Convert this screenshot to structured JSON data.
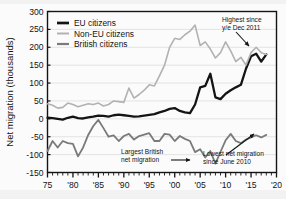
{
  "chart_data": {
    "type": "line",
    "title": "",
    "xlabel": "",
    "ylabel": "Net migration (thousands)",
    "xlim": [
      1975,
      2020
    ],
    "ylim": [
      -150,
      300
    ],
    "ytick_values": [
      300,
      250,
      200,
      150,
      100,
      50,
      0,
      -50,
      -100,
      -150
    ],
    "ytick_labels": [
      "300",
      "250",
      "200",
      "150",
      "100",
      "50",
      "0",
      "-50",
      "-100",
      "-150"
    ],
    "xtick_values": [
      1975,
      1980,
      1985,
      1990,
      1995,
      2000,
      2005,
      2010,
      2015,
      2020
    ],
    "xtick_labels": [
      "75",
      "'80",
      "'85",
      "'90",
      "'95",
      "'00",
      "'05",
      "'10",
      "'15",
      "'20"
    ],
    "minor_xtick_step": 1,
    "grid": "horizontal",
    "legend_position": "top-left",
    "x": [
      1975,
      1976,
      1977,
      1978,
      1979,
      1980,
      1981,
      1982,
      1983,
      1984,
      1985,
      1986,
      1987,
      1988,
      1989,
      1990,
      1991,
      1992,
      1993,
      1994,
      1995,
      1996,
      1997,
      1998,
      1999,
      2000,
      2001,
      2002,
      2003,
      2004,
      2005,
      2006,
      2007,
      2008,
      2009,
      2010,
      2011,
      2012,
      2013,
      2014,
      2015,
      2016,
      2017,
      2018
    ],
    "series": [
      {
        "name": "EU citizens",
        "color": "#141414",
        "width": 2.3,
        "values": [
          3,
          2,
          0,
          -2,
          3,
          6,
          2,
          1,
          4,
          6,
          9,
          8,
          6,
          10,
          12,
          10,
          8,
          6,
          7,
          9,
          11,
          13,
          18,
          22,
          28,
          30,
          22,
          18,
          16,
          40,
          88,
          92,
          126,
          60,
          55,
          70,
          80,
          88,
          95,
          140,
          175,
          182,
          160,
          180
        ]
      },
      {
        "name": "Non-EU citizens",
        "color": "#b2b2b2",
        "width": 1.6,
        "values": [
          42,
          38,
          30,
          32,
          44,
          40,
          34,
          38,
          42,
          40,
          44,
          36,
          40,
          50,
          48,
          46,
          86,
          58,
          68,
          80,
          95,
          92,
          120,
          150,
          200,
          225,
          222,
          235,
          245,
          262,
          205,
          215,
          195,
          170,
          185,
          215,
          190,
          160,
          172,
          150,
          185,
          200,
          185,
          180
        ]
      },
      {
        "name": "British citizens",
        "color": "#7a7a7a",
        "width": 1.8,
        "values": [
          -90,
          -62,
          -80,
          -62,
          -68,
          -70,
          -105,
          -80,
          -45,
          -20,
          -3,
          -26,
          -50,
          -46,
          -62,
          -48,
          -42,
          -58,
          -48,
          -44,
          -40,
          -62,
          -62,
          -42,
          -44,
          -62,
          -48,
          -56,
          -62,
          -93,
          -85,
          -108,
          -90,
          -125,
          -92,
          -60,
          -42,
          -62,
          -68,
          -58,
          -52,
          -46,
          -52,
          -45
        ]
      }
    ],
    "annotations": [
      {
        "name": "highest-since-annotation",
        "line1": "Highest since",
        "line2": "y/e Dec 2011",
        "text_x": 222,
        "text_y": 22,
        "arrow": {
          "x1": 236,
          "y1": 32,
          "x2": 249,
          "y2": 46
        }
      },
      {
        "name": "largest-british-annotation",
        "line1": "Largest British",
        "line2": "net migration",
        "text_x": 121,
        "text_y": 154,
        "arrow": {
          "x1": 171,
          "y1": 160,
          "x2": 190,
          "y2": 160
        }
      },
      {
        "name": "lowest-net-migration-annotation",
        "line1": "Lowest net migration",
        "line2": "since June 2010",
        "text_x": 203,
        "text_y": 156,
        "arrow": {
          "x1": 226,
          "y1": 155,
          "x2": 254,
          "y2": 134
        }
      }
    ]
  },
  "legend": {
    "items": [
      {
        "label": "EU citizens"
      },
      {
        "label": "Non-EU citizens"
      },
      {
        "label": "British citizens"
      }
    ]
  }
}
